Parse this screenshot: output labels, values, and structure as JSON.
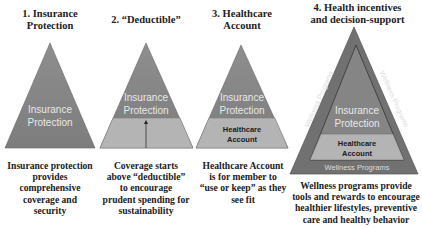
{
  "colors": {
    "dark_gray": "#7f7f7f",
    "mid_gray": "#8a8a8a",
    "light_gray": "#b4b4b4",
    "outer_gray": "#6f6f6f",
    "label_white": "#e8e8e8",
    "label_dark": "#1a1a1a"
  },
  "panels": [
    {
      "title": "1. Insurance Protection",
      "title_lines": [
        "1. Insurance",
        "Protection"
      ],
      "triangle_labels": [
        "Insurance",
        "Protection"
      ],
      "description_lines": [
        "Insurance protection",
        "provides",
        "comprehensive",
        "coverage and",
        "security"
      ]
    },
    {
      "title": "2. “Deductible”",
      "title_lines": [
        "2. “Deductible”"
      ],
      "triangle_labels": [
        "Insurance",
        "Protection"
      ],
      "description_lines": [
        "Coverage starts",
        "above “deductible”",
        "to encourage",
        "prudent spending for",
        "sustainability"
      ]
    },
    {
      "title": "3. Healthcare Account",
      "title_lines": [
        "3. Healthcare",
        "Account"
      ],
      "triangle_labels": [
        "Insurance",
        "Protection"
      ],
      "account_labels": [
        "Healthcare",
        "Account"
      ],
      "description_lines": [
        "Healthcare Account",
        "is for member to",
        "“use or keep” as they",
        "see fit"
      ]
    },
    {
      "title": "4. Health incentives and decision-support",
      "title_lines": [
        "4. Health incentives",
        "and decision-support"
      ],
      "triangle_labels": [
        "Insurance",
        "Protection"
      ],
      "account_labels": [
        "Healthcare",
        "Account"
      ],
      "wellness_label": "Wellness Programs",
      "description_lines": [
        "Wellness programs provide",
        "tools and rewards to encourage",
        "healthier lifestyles, preventive",
        "care and healthy behavior"
      ]
    }
  ]
}
